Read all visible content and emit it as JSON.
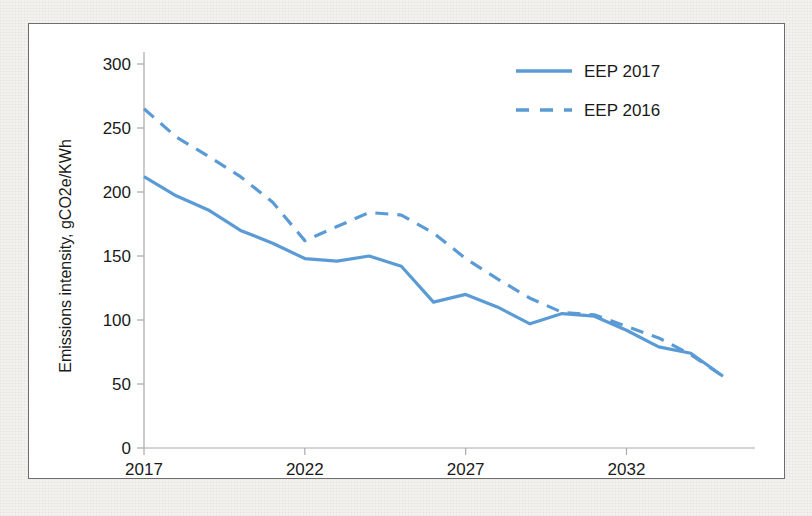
{
  "chart_data": {
    "type": "line",
    "title": "",
    "xlabel": "",
    "ylabel": "Emissions intensity, gCO2e/KWh",
    "ylim": [
      0,
      300
    ],
    "xlim": [
      2017,
      2035
    ],
    "ytick_labels": [
      "0",
      "50",
      "100",
      "150",
      "200",
      "250",
      "300"
    ],
    "ytick_values": [
      0,
      50,
      100,
      150,
      200,
      250,
      300
    ],
    "xtick_labels": [
      "2017",
      "2022",
      "2027",
      "2032"
    ],
    "xtick_values": [
      2017,
      2022,
      2027,
      2032
    ],
    "grid": false,
    "legend_position": "top-right",
    "x": [
      2017,
      2018,
      2019,
      2020,
      2021,
      2022,
      2023,
      2024,
      2025,
      2026,
      2027,
      2028,
      2029,
      2030,
      2031,
      2032,
      2033,
      2034,
      2035
    ],
    "series": [
      {
        "name": "EEP 2017",
        "style": "solid",
        "color": "#5B9BD5",
        "values": [
          212,
          197,
          186,
          170,
          160,
          148,
          146,
          150,
          142,
          114,
          120,
          110,
          97,
          105,
          103,
          92,
          79,
          74,
          56
        ]
      },
      {
        "name": "EEP 2016",
        "style": "dashed",
        "color": "#5B9BD5",
        "values": [
          265,
          243,
          228,
          212,
          192,
          162,
          173,
          184,
          182,
          168,
          148,
          132,
          117,
          106,
          104,
          95,
          86,
          73,
          56
        ]
      }
    ]
  },
  "legend": {
    "items": [
      {
        "label": "EEP 2017",
        "style": "solid"
      },
      {
        "label": "EEP 2016",
        "style": "dashed"
      }
    ]
  },
  "axes": {
    "y_title": "Emissions intensity, gCO2e/KWh"
  }
}
